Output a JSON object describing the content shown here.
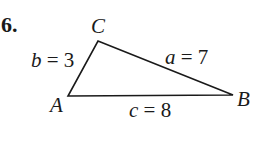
{
  "problem": {
    "number": "6."
  },
  "triangle": {
    "vertices": {
      "A": {
        "label": "A",
        "x": 68,
        "y": 96
      },
      "B": {
        "label": "B",
        "x": 233,
        "y": 95
      },
      "C": {
        "label": "C",
        "x": 98,
        "y": 41
      }
    },
    "sides": {
      "a": {
        "name": "a",
        "eq": " = ",
        "value": "7"
      },
      "b": {
        "name": "b",
        "eq": " = ",
        "value": "3"
      },
      "c": {
        "name": "c",
        "eq": " = ",
        "value": "8"
      }
    },
    "stroke_color": "#1a1a1a"
  }
}
